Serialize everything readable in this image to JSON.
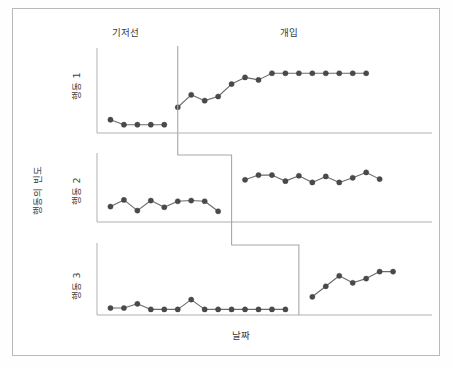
{
  "figure": {
    "title": "",
    "axis": {
      "x_label": "날짜",
      "y_label": "행동의 빈도"
    },
    "phases": [
      {
        "id": "baseline",
        "label": "기저선"
      },
      {
        "id": "intervention",
        "label": "개입"
      }
    ],
    "panels": [
      {
        "id": "panel-1",
        "label": "행동 1"
      },
      {
        "id": "panel-2",
        "label": "행동 2"
      },
      {
        "id": "panel-3",
        "label": "행동 3"
      }
    ],
    "colors": {
      "marker": "#4a4a4a",
      "line": "#6b6b6b",
      "axis": "#b0b0b0",
      "phase_line": "#a8a8a8",
      "frame": "#b9b9b9",
      "background": "#ffffff",
      "text": "#3b3b3b"
    }
  },
  "chart_data": {
    "type": "line",
    "title": "",
    "subtitle": "",
    "xlabel": "날짜",
    "ylabel": "행동의 빈도",
    "grid": false,
    "legend_position": "none",
    "design": "multiple-baseline",
    "annotations": [
      "기저선",
      "개입"
    ],
    "xlim": [
      0,
      24
    ],
    "ylim": [
      0,
      10
    ],
    "panels": [
      {
        "name": "행동 1",
        "phase_change_x": 6.0,
        "series": [
          {
            "name": "기저선",
            "x": [
              1,
              2,
              3,
              4,
              5
            ],
            "values": [
              1.6,
              1.0,
              1.0,
              1.0,
              1.0
            ]
          },
          {
            "name": "개입",
            "x": [
              6,
              7,
              8,
              9,
              10,
              11,
              12,
              13,
              14,
              15,
              16,
              17,
              18,
              19,
              20
            ],
            "values": [
              3.1,
              4.6,
              3.9,
              4.4,
              5.9,
              6.7,
              6.4,
              7.2,
              7.2,
              7.2,
              7.2,
              7.2,
              7.2,
              7.2,
              7.2
            ]
          }
        ]
      },
      {
        "name": "행동 2",
        "phase_change_x": 10.0,
        "series": [
          {
            "name": "기저선",
            "x": [
              1,
              2,
              3,
              4,
              5,
              6,
              7,
              8,
              9
            ],
            "values": [
              2.3,
              3.3,
              1.7,
              3.2,
              2.2,
              3.1,
              3.2,
              3.1,
              1.6
            ]
          },
          {
            "name": "개입",
            "x": [
              11,
              12,
              13,
              14,
              15,
              16,
              17,
              18,
              19,
              20,
              21
            ],
            "values": [
              6.3,
              7.0,
              7.0,
              6.1,
              6.9,
              5.9,
              6.8,
              5.9,
              6.6,
              7.4,
              6.4
            ]
          }
        ]
      },
      {
        "name": "행동 3",
        "phase_change_x": 15.0,
        "series": [
          {
            "name": "기저선",
            "x": [
              1,
              2,
              3,
              4,
              5,
              6,
              7,
              8,
              9,
              10,
              11,
              12,
              13,
              14
            ],
            "values": [
              1.0,
              1.0,
              1.6,
              0.8,
              0.8,
              0.8,
              2.2,
              0.8,
              0.8,
              0.8,
              0.8,
              0.8,
              0.8,
              0.8
            ]
          },
          {
            "name": "개입",
            "x": [
              16,
              17,
              18,
              19,
              20,
              21,
              22
            ],
            "values": [
              2.6,
              4.1,
              5.6,
              4.6,
              5.2,
              6.2,
              6.2
            ]
          }
        ]
      }
    ]
  }
}
